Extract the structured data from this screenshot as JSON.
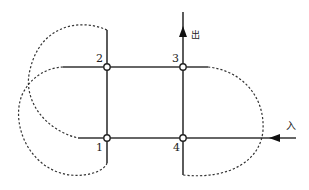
{
  "diagram": {
    "type": "road-intersection-loop-ramps",
    "nodes": [
      {
        "id": "1",
        "label": "1",
        "x": 107,
        "y": 138
      },
      {
        "id": "2",
        "label": "2",
        "x": 107,
        "y": 67
      },
      {
        "id": "3",
        "label": "3",
        "x": 183,
        "y": 67
      },
      {
        "id": "4",
        "label": "4",
        "x": 183,
        "y": 138
      }
    ],
    "labels": {
      "exit": "出",
      "entry": "入"
    },
    "colors": {
      "line": "#333333",
      "dashed": "#333333",
      "node_fill": "#ffffff"
    }
  }
}
